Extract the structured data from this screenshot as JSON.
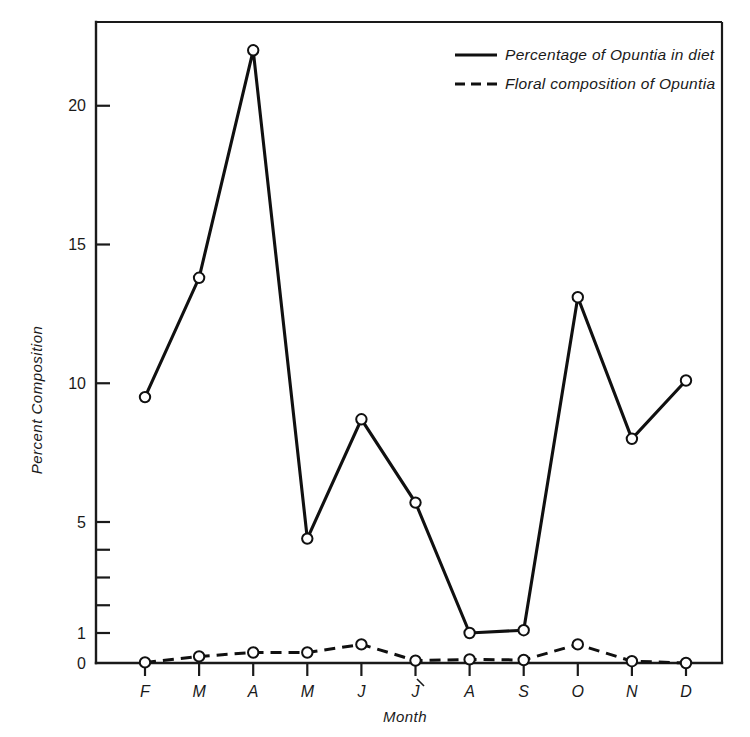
{
  "chart_data": {
    "type": "line",
    "title": "",
    "xlabel": "Month",
    "ylabel": "Percent Composition",
    "categories": [
      "F",
      "M",
      "A",
      "M",
      "J",
      "J",
      "A",
      "S",
      "O",
      "N",
      "D"
    ],
    "x": [
      1,
      2,
      3,
      4,
      5,
      6,
      7,
      8,
      9,
      10,
      11
    ],
    "ylim": [
      0,
      22.8
    ],
    "y_tick_labels": [
      "20",
      "15",
      "10",
      "5",
      "1",
      "0"
    ],
    "y_tick_values": [
      20,
      15,
      10,
      5,
      1,
      0
    ],
    "y_minor_tick_values": [
      4,
      3,
      2
    ],
    "grid": "off",
    "legend_position": "top-right",
    "series": [
      {
        "name": "Percentage of Opuntia in diet",
        "style": "solid",
        "marker": "open-circle",
        "values": [
          9.5,
          13.8,
          22.0,
          4.4,
          8.7,
          5.7,
          1.0,
          1.1,
          13.1,
          8.0,
          10.1
        ]
      },
      {
        "name": "Floral composition of Opuntia",
        "style": "dashed",
        "marker": "open-circle",
        "values": [
          0.02,
          0.22,
          0.35,
          0.35,
          0.62,
          0.08,
          0.12,
          0.1,
          0.62,
          0.06,
          0.0
        ]
      }
    ]
  },
  "legend": {
    "entries": [
      {
        "label": "Percentage of Opuntia in diet",
        "style": "solid"
      },
      {
        "label": "Floral composition of Opuntia",
        "style": "dashed"
      }
    ]
  },
  "axes": {
    "y_title": "Percent Composition",
    "x_title": "Month"
  },
  "colors": {
    "ink": "#101010",
    "background": "#ffffff"
  }
}
